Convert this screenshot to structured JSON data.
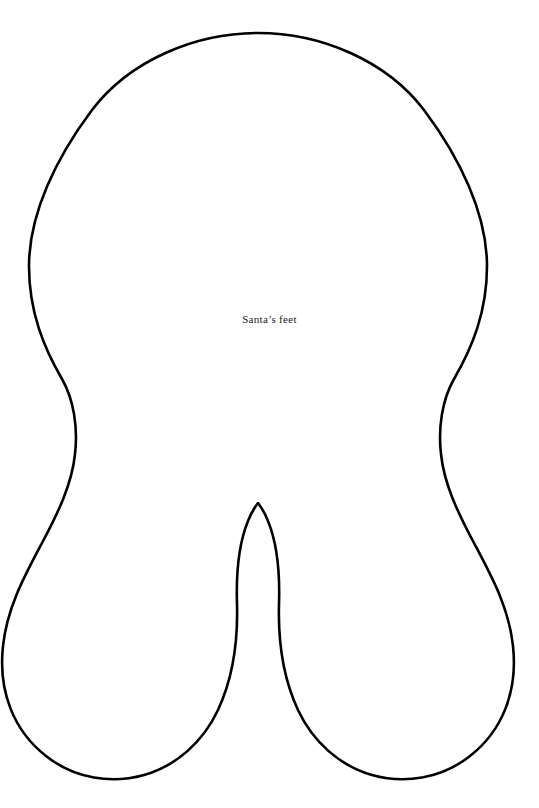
{
  "page": {
    "width": 539,
    "height": 808,
    "background_color": "#ffffff"
  },
  "artwork": {
    "name": "santa-feet-outline",
    "description": "Craft template outline of Santa's feet / boots: a large rounded body with two leg lobes separated by a pointed central notch",
    "stroke_color": "#000000",
    "fill_color": "#ffffff",
    "stroke_width": 2.6,
    "outline_path": "M 258 33 C 196 33, 130 60, 92 110 C 56 158, 29 214, 29 266 C 29 312, 44 348, 62 379 C 74 400, 78 428, 75 454 C 72 484, 58 513, 42 543 C 24 577, 7 608, 3 646 C -2 692, 14 731, 46 756 C 75 779, 112 784, 144 775 C 176 766, 203 742, 218 710 C 233 678, 238 640, 237 604 C 236 573, 239 543, 248 521 C 251 513, 255 507, 258 503 C 261 507, 265 513, 268 521 C 277 543, 280 573, 279 604 C 278 640, 283 678, 298 710 C 313 742, 340 766, 372 775 C 404 784, 441 779, 470 756 C 502 731, 518 692, 513 646 C 509 608, 492 577, 474 543 C 458 513, 444 484, 441 454 C 438 428, 442 400, 454 379 C 472 348, 487 312, 487 266 C 487 214, 460 158, 424 110 C 386 60, 320 33, 258 33 Z"
  },
  "caption": {
    "text": "Santa’s feet"
  }
}
